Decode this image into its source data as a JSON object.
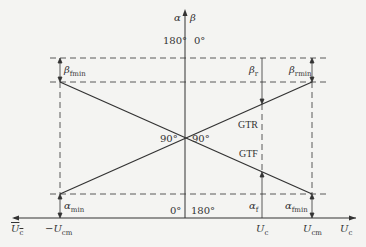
{
  "diagram": {
    "vertical_axis": {
      "left_label": "α",
      "right_label": "β"
    },
    "top_ticks": {
      "alpha": "180°",
      "beta": "0°"
    },
    "bottom_ticks": {
      "alpha": "0°",
      "beta": "180°"
    },
    "center_angles": {
      "left": "90°",
      "right": "90°"
    },
    "curves": {
      "rectifier": "GTR",
      "inverter": "GTF"
    },
    "left_labels": {
      "beta_min": {
        "sym": "β",
        "sub": "fmin"
      },
      "alpha_min": {
        "sym": "α",
        "sub": "min"
      }
    },
    "right_labels": {
      "beta_r": {
        "sym": "β",
        "sub": "r"
      },
      "beta_min": {
        "sym": "β",
        "sub": "rmin"
      },
      "alpha_f": {
        "sym": "α",
        "sub": "f"
      },
      "alpha_min": {
        "sym": "α",
        "sub": "fmin"
      }
    },
    "horizontal_axis": {
      "left_end": {
        "sym": "U",
        "sub": "c",
        "overbar": true
      },
      "neg_max": {
        "prefix": "−",
        "sym": "U",
        "sub": "cm"
      },
      "uc": {
        "sym": "U",
        "sub": "c"
      },
      "pos_max": {
        "sym": "U",
        "sub": "cm"
      },
      "right_end": {
        "sym": "U",
        "sub": "c"
      }
    },
    "colors": {
      "line": "#333333",
      "background": "#f4f4f2"
    }
  }
}
